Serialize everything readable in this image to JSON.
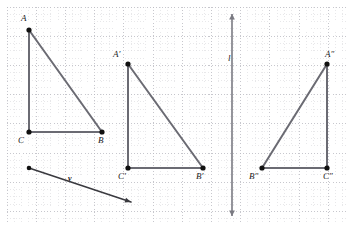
{
  "figure": {
    "type": "geometry-diagram",
    "grid": {
      "origin_x": 7,
      "origin_y": 7,
      "width": 341,
      "height": 215,
      "minor_step": 7.3,
      "major_step": 29.2,
      "minor_color": "#d8d8dc",
      "major_color": "#b9b9c0",
      "show_grid": true
    },
    "style": {
      "segment_color": "#6b6b73",
      "segment_width": 2,
      "vector_color": "#3a3a3f",
      "vector_width": 1.4,
      "line_color": "#7a7a82",
      "line_width": 1.6,
      "vertex_color": "#111111",
      "vertex_radius": 2.6
    },
    "shapes": [
      {
        "name": "triangle-abc",
        "vertices": [
          {
            "id": "A",
            "x": 29,
            "y": 30,
            "label": "A",
            "label_x": 21,
            "label_y": 14
          },
          {
            "id": "B",
            "x": 102,
            "y": 132,
            "label": "B",
            "label_x": 98,
            "label_y": 136
          },
          {
            "id": "C",
            "x": 29,
            "y": 132,
            "label": "C",
            "label_x": 18,
            "label_y": 136
          }
        ],
        "edges": [
          [
            "A",
            "B"
          ],
          [
            "A",
            "C"
          ],
          [
            "C",
            "B"
          ]
        ]
      },
      {
        "name": "triangle-a-prime-b-prime-c-prime",
        "vertices": [
          {
            "id": "A'",
            "x": 128,
            "y": 64,
            "label": "A′",
            "label_x": 113,
            "label_y": 50
          },
          {
            "id": "B'",
            "x": 203,
            "y": 168,
            "label": "B′",
            "label_x": 196,
            "label_y": 172
          },
          {
            "id": "C'",
            "x": 128,
            "y": 168,
            "label": "C′",
            "label_x": 118,
            "label_y": 172
          }
        ],
        "edges": [
          [
            "A'",
            "B'"
          ],
          [
            "A'",
            "C'"
          ],
          [
            "C'",
            "B'"
          ]
        ]
      },
      {
        "name": "triangle-a-double-prime-b-double-prime-c-double-prime",
        "vertices": [
          {
            "id": "A''",
            "x": 327,
            "y": 64,
            "label": "A″",
            "label_x": 325,
            "label_y": 50
          },
          {
            "id": "B''",
            "x": 262,
            "y": 168,
            "label": "B″",
            "label_x": 249,
            "label_y": 172
          },
          {
            "id": "C''",
            "x": 327,
            "y": 168,
            "label": "C″",
            "label_x": 323,
            "label_y": 172
          }
        ],
        "edges": [
          [
            "A''",
            "B''"
          ],
          [
            "A''",
            "C''"
          ],
          [
            "C''",
            "B''"
          ]
        ]
      }
    ],
    "vector": {
      "name": "translation-vector-v",
      "label": "v",
      "label_x": 68,
      "label_y": 175,
      "start_x": 29,
      "start_y": 168,
      "end_x": 131,
      "end_y": 202,
      "arrowhead": "end"
    },
    "reflection_line": {
      "name": "reflection-line-l",
      "label": "l",
      "label_x": 228,
      "label_y": 54,
      "x": 232,
      "y_top": 14,
      "y_bottom": 216,
      "arrowhead": "both"
    }
  }
}
